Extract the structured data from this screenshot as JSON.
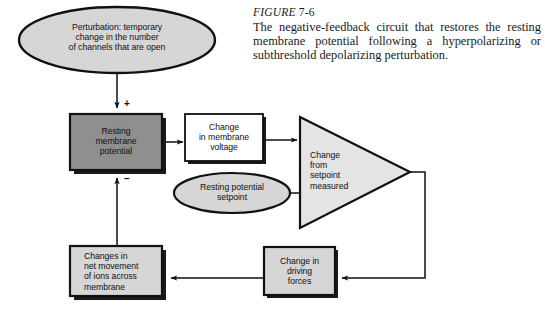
{
  "figure": {
    "label_prefix": "FIGURE",
    "label_number": "7-6",
    "caption": "The negative-feedback circuit that restores the resting membrane potential following a hyperpolarizing or subthreshold depolarizing perturbation."
  },
  "diagram": {
    "type": "flowchart",
    "nodes": [
      {
        "id": "perturbation",
        "shape": "ellipse",
        "fill": "#d6d6d6",
        "text": "Perturbation: temporary change in the number of channels that are open",
        "lines": [
          "Perturbation: temporary",
          "change in the number",
          "of channels that are open"
        ]
      },
      {
        "id": "resting-membrane-potential",
        "shape": "rect",
        "fill": "#8f8f8f",
        "text": "Resting membrane potential",
        "lines": [
          "Resting",
          "membrane",
          "potential"
        ]
      },
      {
        "id": "change-in-membrane-voltage",
        "shape": "rect",
        "fill": "#ffffff",
        "text": "Change in membrane voltage",
        "lines": [
          "Change",
          "in membrane",
          "voltage"
        ]
      },
      {
        "id": "resting-potential-setpoint",
        "shape": "ellipse",
        "fill": "#d6d6d6",
        "text": "Resting potential setpoint",
        "lines": [
          "Resting potential",
          "setpoint"
        ]
      },
      {
        "id": "change-from-setpoint-measured",
        "shape": "triangle",
        "fill": "#e4e4e4",
        "text": "Change from setpoint measured",
        "lines": [
          "Change",
          "from",
          "setpoint",
          "measured"
        ]
      },
      {
        "id": "change-in-driving-forces",
        "shape": "rect",
        "fill": "#d6d6d6",
        "text": "Change in driving forces",
        "lines": [
          "Change in",
          "driving",
          "forces"
        ]
      },
      {
        "id": "changes-in-net-movement",
        "shape": "rect",
        "fill": "#d6d6d6",
        "text": "Changes in net movement of ions across membrane",
        "lines": [
          "Changes in",
          "net movement",
          "of ions across",
          "membrane"
        ]
      }
    ],
    "signs": [
      {
        "id": "plus-sign",
        "symbol": "+"
      },
      {
        "id": "minus-sign",
        "symbol": "–"
      }
    ],
    "colors": {
      "stroke": "#111111",
      "shadow": "#1a1a1a",
      "dark_fill": "#8f8f8f",
      "light_fill": "#d6d6d6",
      "pale_fill": "#e4e4e4",
      "white_fill": "#ffffff",
      "background": "#ffffff"
    }
  }
}
